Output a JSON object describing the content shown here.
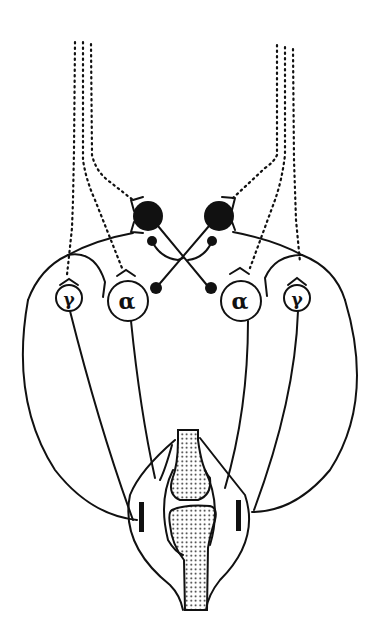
{
  "diagram": {
    "type": "neural-circuit",
    "description_label": "Spinal motor control of an antagonist muscle pair across a joint",
    "colors": {
      "ink": "#111111",
      "background": "#ffffff",
      "bone_stipple": "#111111"
    },
    "neurons": {
      "left_alpha": {
        "symbol": "α"
      },
      "right_alpha": {
        "symbol": "α"
      },
      "left_gamma": {
        "symbol": "γ"
      },
      "right_gamma": {
        "symbol": "γ"
      }
    },
    "elements": [
      "descending-tracts-left",
      "descending-tracts-right",
      "inhibitory-interneuron-left",
      "inhibitory-interneuron-right",
      "crossed-inhibitory-axons",
      "alpha-motor-neurons",
      "gamma-motor-neurons",
      "afferent-loops",
      "muscle-spindles",
      "joint-bones"
    ]
  }
}
